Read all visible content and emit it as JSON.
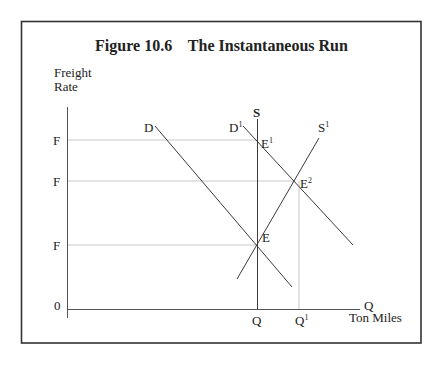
{
  "figure": {
    "title": "Figure 10.6    The Instantaneous Run",
    "y_axis_label_line1": "Freight",
    "y_axis_label_line2": "Rate",
    "x_axis_end_label": "Q",
    "x_axis_unit_label": "Ton Miles",
    "origin_label": "0"
  },
  "y_ticks": [
    {
      "label": "F",
      "y_level": "high",
      "ends_at": "E1"
    },
    {
      "label": "F",
      "y_level": "middle",
      "ends_at": "E2"
    },
    {
      "label": "F",
      "y_level": "low",
      "ends_at": "E"
    }
  ],
  "x_ticks": [
    {
      "label": "Q",
      "sup": ""
    },
    {
      "label": "Q",
      "sup": "1"
    }
  ],
  "curves": {
    "D": {
      "label": "D",
      "sup": "",
      "type": "demand"
    },
    "D1": {
      "label": "D",
      "sup": "1",
      "type": "demand (shifted)"
    },
    "S": {
      "label": "S",
      "sup": "",
      "type": "supply (vertical, instantaneous)"
    },
    "S1": {
      "label": "S",
      "sup": "1",
      "type": "supply (upward sloping)"
    }
  },
  "points": {
    "E": {
      "label": "E",
      "sup": ""
    },
    "E1": {
      "label": "E",
      "sup": "1"
    },
    "E2": {
      "label": "E",
      "sup": "2"
    }
  }
}
